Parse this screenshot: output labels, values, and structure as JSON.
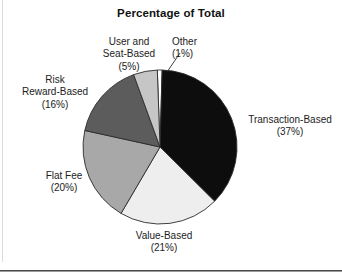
{
  "chart_data": {
    "type": "pie",
    "title": "Percentage of Total",
    "xlabel": "",
    "ylabel": "",
    "legend_position": "none",
    "grid": false,
    "labels_outside": true,
    "start_angle_deg": -2,
    "direction": "clockwise",
    "categories": [
      "Other",
      "Transaction-Based",
      "Value-Based",
      "Flat Fee",
      "Risk Reward-Based",
      "User and Seat-Based"
    ],
    "values": [
      1,
      37,
      21,
      20,
      16,
      5
    ],
    "units": "percent",
    "total": 100,
    "slices": [
      {
        "name": "Other",
        "value": 1,
        "value_text": "(1%)",
        "label_line1": "Other",
        "label_line2": "(1%)",
        "color": "#ffffff",
        "has_leader_line": true
      },
      {
        "name": "Transaction-Based",
        "value": 37,
        "value_text": "(37%)",
        "label_line1": "Transaction-Based",
        "label_line2": "(37%)",
        "color": "#0d0d0d",
        "has_leader_line": false
      },
      {
        "name": "Value-Based",
        "value": 21,
        "value_text": "(21%)",
        "label_line1": "Value-Based",
        "label_line2": "(21%)",
        "color": "#eeeeee",
        "has_leader_line": false
      },
      {
        "name": "Flat Fee",
        "value": 20,
        "value_text": "(20%)",
        "label_line1": "Flat Fee",
        "label_line2": "(20%)",
        "color": "#a8a8a8",
        "has_leader_line": false
      },
      {
        "name": "Risk Reward-Based",
        "value": 16,
        "value_text": "(16%)",
        "label_line1": "Risk",
        "label_line2": "Reward-Based",
        "label_line3": "(16%)",
        "color": "#5c5c5c",
        "has_leader_line": false
      },
      {
        "name": "User and Seat-Based",
        "value": 5,
        "value_text": "(5%)",
        "label_line1": "User and",
        "label_line2": "Seat-Based",
        "label_line3": "(5%)",
        "color": "#c6c6c6",
        "has_leader_line": false
      }
    ]
  },
  "labels": {
    "title": "Percentage of Total",
    "user_seat_based": "User and\nSeat-Based\n(5%)",
    "other": "Other\n(1%)",
    "risk_reward_based": "Risk\nReward-Based\n(16%)",
    "flat_fee": "Flat Fee\n(20%)",
    "value_based": "Value-Based\n(21%)",
    "transaction_based": "Transaction-Based\n(37%)"
  },
  "colors": {
    "transaction_based": "#0d0d0d",
    "value_based": "#eeeeee",
    "flat_fee": "#a8a8a8",
    "risk_reward_based": "#5c5c5c",
    "user_seat_based": "#c6c6c6",
    "other": "#ffffff",
    "outline": "#2b2b2b",
    "background": "#ffffff",
    "text": "#1c1c1c"
  },
  "geometry": {
    "center_x": 160,
    "center_y": 147,
    "radius": 77
  }
}
